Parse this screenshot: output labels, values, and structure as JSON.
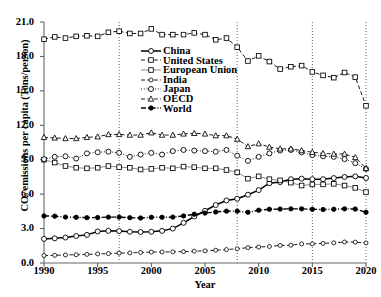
{
  "chart_data": {
    "type": "line",
    "title": "",
    "xlabel": "Year",
    "ylabel": "CO₂ emissions per capita (Tons/person)",
    "xlim": [
      1990,
      2020
    ],
    "ylim": [
      0.0,
      21.0
    ],
    "ytick_labels": [
      "0.0",
      "3.0",
      "6.0",
      "9.0",
      "12.0",
      "15.0",
      "18.0",
      "21.0"
    ],
    "ytick_values": [
      0.0,
      3.0,
      6.0,
      9.0,
      12.0,
      15.0,
      18.0,
      21.0
    ],
    "xtick_labels": [
      "1990",
      "1995",
      "2000",
      "2005",
      "2010",
      "2015",
      "2020"
    ],
    "xtick_values": [
      1990,
      1995,
      2000,
      2005,
      2010,
      2015,
      2020
    ],
    "grid": false,
    "legend_position": "upper-center-right",
    "vertical_reference_lines": [
      1997,
      2008,
      2015,
      2020
    ],
    "x": [
      1990,
      1991,
      1992,
      1993,
      1994,
      1995,
      1996,
      1997,
      1998,
      1999,
      2000,
      2001,
      2002,
      2003,
      2004,
      2005,
      2006,
      2007,
      2008,
      2009,
      2010,
      2011,
      2012,
      2013,
      2014,
      2015,
      2016,
      2017,
      2018,
      2019,
      2020
    ],
    "series": [
      {
        "name": "China",
        "marker": "circle-open",
        "line": "solid",
        "values": [
          2.1,
          2.15,
          2.22,
          2.35,
          2.45,
          2.75,
          2.8,
          2.78,
          2.72,
          2.7,
          2.72,
          2.8,
          3.0,
          3.5,
          4.05,
          4.55,
          5.05,
          5.45,
          5.6,
          5.95,
          6.35,
          6.95,
          7.05,
          7.3,
          7.35,
          7.3,
          7.3,
          7.4,
          7.5,
          7.55,
          7.41
        ]
      },
      {
        "name": "United States",
        "marker": "square-open",
        "line": "dashed",
        "values": [
          19.5,
          19.7,
          19.6,
          19.75,
          19.8,
          19.75,
          20.1,
          20.2,
          20.0,
          20.0,
          20.4,
          19.9,
          19.9,
          19.9,
          20.05,
          19.9,
          19.45,
          19.6,
          18.8,
          17.6,
          18.05,
          17.55,
          16.9,
          17.1,
          17.2,
          16.65,
          16.35,
          16.15,
          16.6,
          16.2,
          13.7
        ]
      },
      {
        "name": "European Union",
        "marker": "square-open",
        "line": "solid-thin",
        "values": [
          9.0,
          8.75,
          8.45,
          8.3,
          8.25,
          8.3,
          8.45,
          8.35,
          8.3,
          8.15,
          8.2,
          8.3,
          8.25,
          8.4,
          8.35,
          8.25,
          8.25,
          8.1,
          7.9,
          7.35,
          7.55,
          7.3,
          7.2,
          7.0,
          6.75,
          6.85,
          6.85,
          6.9,
          6.75,
          6.55,
          6.18
        ]
      },
      {
        "name": "India",
        "marker": "circle-small-open",
        "line": "dashed",
        "values": [
          0.65,
          0.67,
          0.7,
          0.72,
          0.75,
          0.79,
          0.82,
          0.86,
          0.88,
          0.92,
          0.95,
          0.96,
          0.97,
          0.99,
          1.03,
          1.06,
          1.11,
          1.17,
          1.24,
          1.34,
          1.39,
          1.44,
          1.53,
          1.55,
          1.66,
          1.67,
          1.71,
          1.76,
          1.83,
          1.82,
          1.75
        ]
      },
      {
        "name": "Japan",
        "marker": "circle-open",
        "line": "dotted",
        "values": [
          9.05,
          9.25,
          9.3,
          9.1,
          9.55,
          9.65,
          9.7,
          9.6,
          9.25,
          9.45,
          9.6,
          9.45,
          9.75,
          9.85,
          9.8,
          9.75,
          9.7,
          9.85,
          9.35,
          8.9,
          9.25,
          9.55,
          9.8,
          9.85,
          9.65,
          9.4,
          9.3,
          9.25,
          9.05,
          8.7,
          8.2
        ]
      },
      {
        "name": "OECD",
        "marker": "triangle-open",
        "line": "dashed",
        "values": [
          10.95,
          10.9,
          10.85,
          10.85,
          10.95,
          11.0,
          11.2,
          11.2,
          11.15,
          11.15,
          11.35,
          11.15,
          11.15,
          11.25,
          11.3,
          11.25,
          11.1,
          11.1,
          10.8,
          10.15,
          10.4,
          10.1,
          9.95,
          9.95,
          9.8,
          9.65,
          9.55,
          9.5,
          9.5,
          9.2,
          8.25
        ]
      },
      {
        "name": "World",
        "marker": "circle-filled",
        "line": "dash-dot",
        "values": [
          4.1,
          4.08,
          4.0,
          3.98,
          3.95,
          3.96,
          4.0,
          4.0,
          3.95,
          3.92,
          3.98,
          3.98,
          4.0,
          4.1,
          4.25,
          4.35,
          4.45,
          4.52,
          4.52,
          4.42,
          4.6,
          4.68,
          4.7,
          4.72,
          4.72,
          4.68,
          4.66,
          4.68,
          4.72,
          4.7,
          4.42
        ]
      }
    ]
  }
}
